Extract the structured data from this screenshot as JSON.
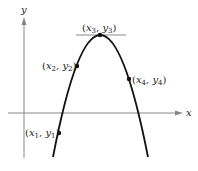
{
  "diagram": {
    "type": "parabola-graph",
    "axes": {
      "x_label": "x",
      "y_label": "y"
    },
    "curve": "downward-opening parabola",
    "tangent_at": "vertex",
    "points": [
      {
        "id": "p1",
        "x_var": "x",
        "y_var": "y",
        "sub": "1",
        "position": "left-lower, below x-axis"
      },
      {
        "id": "p2",
        "x_var": "x",
        "y_var": "y",
        "sub": "2",
        "position": "left branch, above x-axis"
      },
      {
        "id": "p3",
        "x_var": "x",
        "y_var": "y",
        "sub": "3",
        "position": "vertex"
      },
      {
        "id": "p4",
        "x_var": "x",
        "y_var": "y",
        "sub": "4",
        "position": "right branch, above x-axis"
      }
    ],
    "colors": {
      "curve": "#111111",
      "axes": "#777777",
      "tangent": "#777777",
      "text": "#222222"
    }
  }
}
